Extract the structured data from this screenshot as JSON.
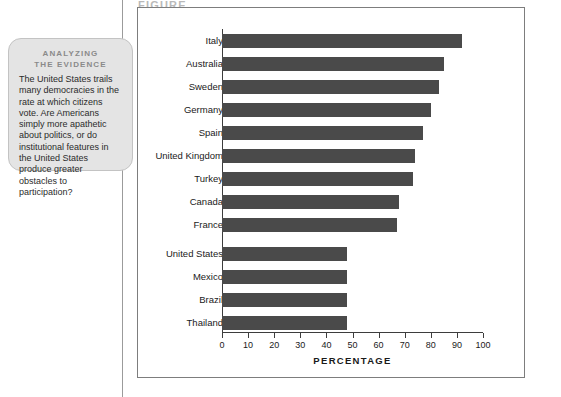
{
  "page": {
    "header_fragment": "FIGURE"
  },
  "callout": {
    "title_line1": "ANALYZING",
    "title_line2": "THE EVIDENCE",
    "body": "The United States trails many democracies in the rate at which citizens vote. Are Americans simply more apathetic about politics, or do institutional features in the United States produce greater obstacles to participation?"
  },
  "colors": {
    "bar": "#4a4a4a",
    "callout_background": "#e4e4e4",
    "axis": "#3d3d3d",
    "frame": "#7d7d7d"
  },
  "chart_data": {
    "type": "bar",
    "orientation": "horizontal",
    "title": "",
    "subtitle": "",
    "xlabel": "PERCENTAGE",
    "ylabel": "",
    "xlim": [
      0,
      100
    ],
    "xticks": [
      0,
      10,
      20,
      30,
      40,
      50,
      60,
      70,
      80,
      90,
      100
    ],
    "grid": false,
    "legend": null,
    "categories": [
      "Italy",
      "Australia",
      "Sweden",
      "Germany",
      "Spain",
      "United Kingdom",
      "Turkey",
      "Canada",
      "France",
      "United States",
      "Mexico",
      "Brazil",
      "Thailand"
    ],
    "values": [
      92,
      85,
      83,
      80,
      77,
      74,
      73,
      68,
      67,
      48,
      48,
      48,
      48
    ]
  }
}
